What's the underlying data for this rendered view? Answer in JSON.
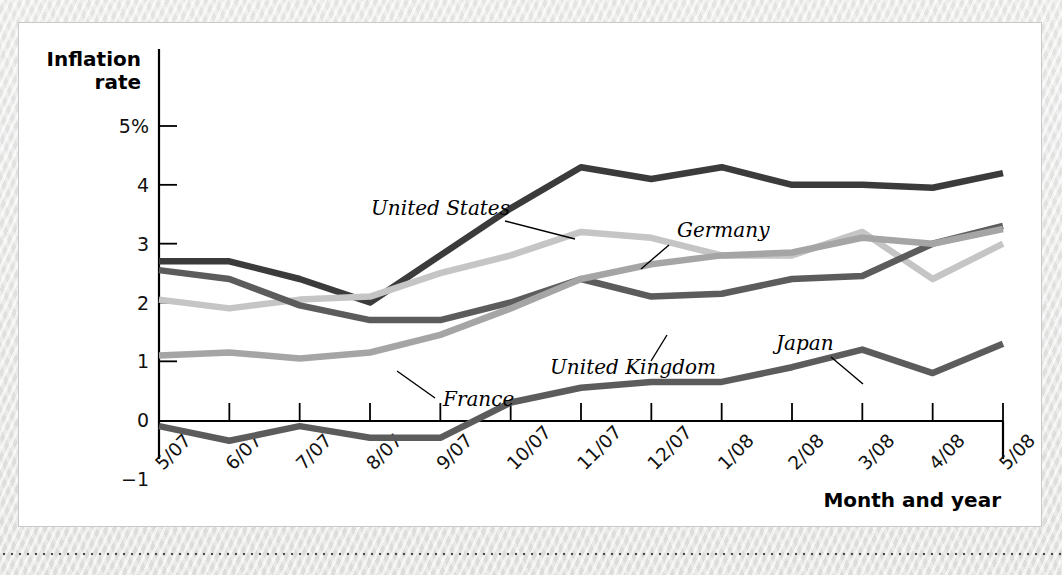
{
  "figure": {
    "y_axis_title_line1": "Inflation",
    "y_axis_title_line2": "rate",
    "x_axis_title": "Month and year"
  },
  "chart_data": {
    "type": "line",
    "title": "",
    "xlabel": "Month and year",
    "ylabel": "Inflation rate",
    "ylim": [
      -1,
      5.4
    ],
    "ytick_labels": [
      "5%",
      "4",
      "3",
      "2",
      "1",
      "0",
      "-1"
    ],
    "ytick_values": [
      5,
      4,
      3,
      2,
      1,
      0,
      -1
    ],
    "grid": false,
    "legend_position": "inline-annotations",
    "categories": [
      "5/07",
      "6/07",
      "7/07",
      "8/07",
      "9/07",
      "10/07",
      "11/07",
      "12/07",
      "1/08",
      "2/08",
      "3/08",
      "4/08",
      "5/08"
    ],
    "series": [
      {
        "name": "United States",
        "color": "#3b3b3b",
        "values": [
          2.7,
          2.7,
          2.4,
          2.0,
          2.8,
          3.6,
          4.3,
          4.1,
          4.3,
          4.0,
          4.0,
          3.95,
          4.2
        ]
      },
      {
        "name": "Germany",
        "color": "#c5c5c5",
        "values": [
          2.05,
          1.9,
          2.05,
          2.1,
          2.5,
          2.8,
          3.2,
          3.1,
          2.8,
          2.8,
          3.2,
          2.4,
          3.0
        ]
      },
      {
        "name": "United Kingdom",
        "color": "#5c5c5c",
        "values": [
          2.55,
          2.4,
          1.95,
          1.7,
          1.7,
          2.0,
          2.4,
          2.1,
          2.15,
          2.4,
          2.45,
          3.0,
          3.3
        ]
      },
      {
        "name": "France",
        "color": "#a5a5a5",
        "values": [
          1.1,
          1.15,
          1.05,
          1.15,
          1.45,
          1.9,
          2.4,
          2.65,
          2.8,
          2.85,
          3.1,
          3.0,
          3.25
        ]
      },
      {
        "name": "Japan",
        "color": "#5c5c5c",
        "values": [
          -0.1,
          -0.35,
          -0.1,
          -0.3,
          -0.3,
          0.3,
          0.55,
          0.65,
          0.65,
          0.9,
          1.2,
          0.8,
          1.3
        ]
      }
    ],
    "annotations": [
      {
        "text": "United States",
        "x": 352,
        "y": 192,
        "leader": "M486,198 L556,216"
      },
      {
        "text": "Germany",
        "x": 658,
        "y": 214,
        "leader": "M650,222 L622,246"
      },
      {
        "text": "United Kingdom",
        "x": 531,
        "y": 351,
        "leader": "M632,338 L648,312"
      },
      {
        "text": "France",
        "x": 424,
        "y": 383,
        "leader": "M416,375 L378,348"
      },
      {
        "text": "Japan",
        "x": 757,
        "y": 327,
        "leader": "M812,334 L844,361"
      }
    ]
  }
}
